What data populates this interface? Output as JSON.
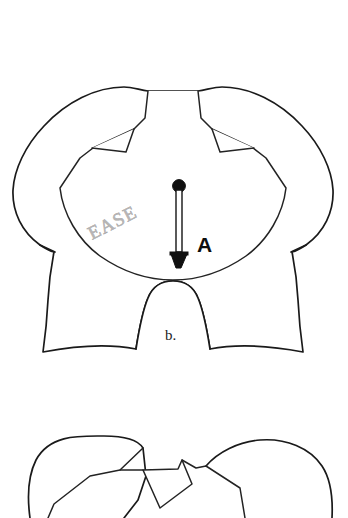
{
  "figure": {
    "background_color": "#ffffff",
    "line_color": "#1a1a1a",
    "width": 348,
    "height": 518
  },
  "labels": {
    "ease": "EASE",
    "ease_color": "#b6b4b4",
    "point_a": "A",
    "point_a_color": "#0d0d0d",
    "figure_b": "b.",
    "figure_b_color": "#1d1d1d"
  },
  "markers": {
    "ease_arrow_name": "ease-measure-arrow",
    "ease_arrow_color": "#101010"
  },
  "shapes": {
    "main_piece_name": "main-pattern-piece",
    "inner_panel_name": "inner-yoke-panel",
    "lower_piece_name": "lower-pattern-piece"
  }
}
